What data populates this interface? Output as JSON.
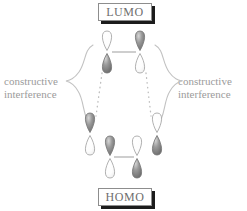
{
  "figure": {
    "background_color": "#ffffff"
  },
  "labels": {
    "lumo": "LUMO",
    "homo": "HOMO"
  },
  "annotations": {
    "left": {
      "line1": "constructive",
      "line2": "interference"
    },
    "right": {
      "line1": "constructive",
      "line2": "interference"
    }
  },
  "colors": {
    "lobe_filled": "#8a8a8a",
    "lobe_empty": "#ffffff",
    "outline": "#a8a8a8",
    "text": "#6e6e6e",
    "annotation_text": "#9b9b9b",
    "box_border": "#8d8d8d",
    "box_shadow": "#1c1c1c",
    "connector": "#b4b4b4",
    "dotted": "#bdbdbd",
    "brace": "#c2c2c2"
  },
  "orbitals": [
    {
      "id": "lumo-left",
      "group": "lumo",
      "x": 107,
      "y": 52,
      "top_phase": "empty",
      "bottom_phase": "filled"
    },
    {
      "id": "lumo-right",
      "group": "lumo",
      "x": 140,
      "y": 52,
      "top_phase": "filled",
      "bottom_phase": "empty"
    },
    {
      "id": "homo-outer-left",
      "group": "homo",
      "x": 90,
      "y": 134,
      "top_phase": "filled",
      "bottom_phase": "empty"
    },
    {
      "id": "homo-inner-left",
      "group": "homo",
      "x": 110,
      "y": 157,
      "top_phase": "filled",
      "bottom_phase": "empty"
    },
    {
      "id": "homo-inner-right",
      "group": "homo",
      "x": 137,
      "y": 157,
      "top_phase": "empty",
      "bottom_phase": "filled"
    },
    {
      "id": "homo-outer-right",
      "group": "homo",
      "x": 157,
      "y": 134,
      "top_phase": "empty",
      "bottom_phase": "filled"
    }
  ],
  "connectors": [
    {
      "id": "lumo-bond",
      "x1": 112,
      "y1": 52,
      "x2": 136,
      "y2": 52
    },
    {
      "id": "homo-bond",
      "x1": 114,
      "y1": 157,
      "x2": 134,
      "y2": 157
    }
  ],
  "interference_lines": [
    {
      "id": "dotted-left",
      "x1": 102,
      "y1": 73,
      "x2": 96,
      "y2": 116
    },
    {
      "id": "dotted-right",
      "x1": 146,
      "y1": 73,
      "x2": 151,
      "y2": 116
    }
  ],
  "braces": [
    {
      "id": "brace-left",
      "side": "left"
    },
    {
      "id": "brace-right",
      "side": "right"
    }
  ]
}
